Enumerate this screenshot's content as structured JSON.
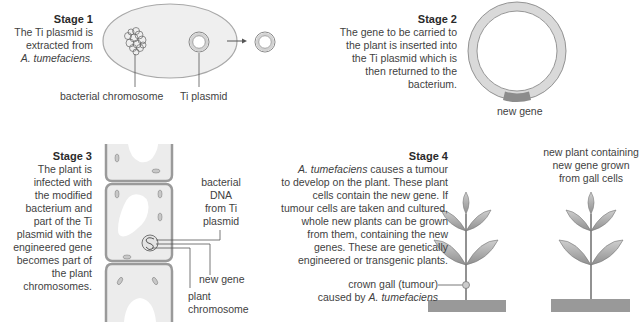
{
  "stage1": {
    "title": "Stage 1",
    "lines": [
      "The Ti plasmid is",
      "extracted from",
      "A. tumefaciens."
    ],
    "labels": {
      "chromosome": "bacterial chromosome",
      "plasmid": "Ti plasmid"
    }
  },
  "stage2": {
    "title": "Stage 2",
    "lines": [
      "The gene to be carried to",
      "the plant is inserted into",
      "the Ti plasmid which is",
      "then returned to the",
      "bacterium."
    ],
    "labels": {
      "new_gene": "new gene"
    }
  },
  "stage3": {
    "title": "Stage 3",
    "lines": [
      "The plant is",
      "infected with",
      "the modified",
      "bacterium and",
      "part of the Ti",
      "plasmid with the",
      "engineered gene",
      "becomes part of",
      "the plant",
      "chromosomes."
    ],
    "labels": {
      "bacterial_dna": [
        "bacterial",
        "DNA",
        "from Ti",
        "plasmid"
      ],
      "new_gene": "new gene",
      "plant_chromosome": [
        "plant",
        "chromosome"
      ]
    }
  },
  "stage4": {
    "title": "Stage 4",
    "lines_first_italic": "A. tumefaciens",
    "lines_first_rest": " causes a tumour",
    "lines": [
      "to develop on the plant. These plant",
      "cells contain the new gene. If",
      "tumour cells are taken and cultured,",
      "whole new plants can be grown",
      "from them, containing the new",
      "genes. These are genetically",
      "engineered or transgenic plants."
    ],
    "labels": {
      "crown_gall_1": "crown gall (tumour)",
      "crown_gall_2a": "caused by ",
      "crown_gall_2b": "A. tumefaciens",
      "new_plant": [
        "new plant containing",
        "new gene grown",
        "from gall cells"
      ]
    }
  },
  "colors": {
    "cell_fill": "#ececec",
    "cell_wall": "#9a9a9a",
    "plasmid_ring": "#d9d9d9",
    "gene_band": "#8c8c8c",
    "leaf": "#a9a9a9",
    "ground": "#999999"
  }
}
